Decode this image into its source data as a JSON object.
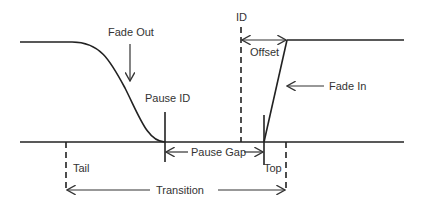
{
  "diagram": {
    "labels": {
      "fade_out": "Fade Out",
      "fade_in": "Fade In",
      "pause_id": "Pause ID",
      "id": "ID",
      "offset": "Offset",
      "pause_gap": "Pause Gap",
      "tail": "Tail",
      "top": "Top",
      "transition": "Transition"
    },
    "colors": {
      "line": "#222222",
      "text": "#333333",
      "background": "#ffffff"
    }
  }
}
